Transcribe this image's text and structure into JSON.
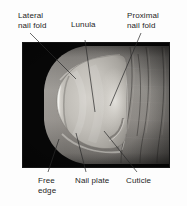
{
  "figure": {
    "kind": "anatomical-photograph-diagram",
    "background_color": "#fdfdfd",
    "photo": {
      "background_color": "#0a0a0a",
      "nail_color": "#b9b6b0",
      "skin_color": "#8d8a86",
      "highlight_color": "#e6e4df",
      "left": 22,
      "top": 42,
      "width": 148,
      "height": 126
    },
    "label_color": "#1d1d1d",
    "leader_color": "#2a2a2a"
  },
  "labels": [
    {
      "id": "lateral-nail-fold",
      "text": "Lateral\nnail fold"
    },
    {
      "id": "lunula",
      "text": "Lunula"
    },
    {
      "id": "proximal-nail-fold",
      "text": "Proximal\nnail fold"
    },
    {
      "id": "free-edge",
      "text": "Free\nedge"
    },
    {
      "id": "nail-plate",
      "text": "Nail plate"
    },
    {
      "id": "cuticle",
      "text": "Cuticle"
    }
  ]
}
